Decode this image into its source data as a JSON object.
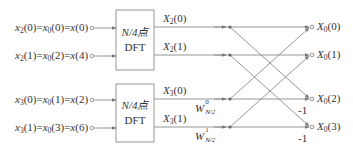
{
  "diagram": {
    "inputs": [
      {
        "id": "in0",
        "text": "x2(0)=x0(0)=x(0)",
        "parts": [
          [
            "x",
            "2",
            "(0)="
          ],
          [
            "x",
            "0",
            "(0)="
          ],
          [
            "x",
            "",
            "(0)"
          ]
        ],
        "y": 28
      },
      {
        "id": "in1",
        "text": "x2(1)=x0(2)=x(4)",
        "parts": [
          [
            "x",
            "2",
            "(1)="
          ],
          [
            "x",
            "0",
            "(2)="
          ],
          [
            "x",
            "",
            "(4)"
          ]
        ],
        "y": 56
      },
      {
        "id": "in2",
        "text": "x3(0)=x0(1)=x(2)",
        "parts": [
          [
            "x",
            "3",
            "(0)="
          ],
          [
            "x",
            "0",
            "(1)="
          ],
          [
            "x",
            "",
            "(2)"
          ]
        ],
        "y": 100
      },
      {
        "id": "in3",
        "text": "x3(1)=x0(3)=x(6)",
        "parts": [
          [
            "x",
            "3",
            "(1)="
          ],
          [
            "x",
            "0",
            "(3)="
          ],
          [
            "x",
            "",
            "(6)"
          ]
        ],
        "y": 128
      }
    ],
    "blocks": [
      {
        "id": "dft-top",
        "line1": "N/4点",
        "line2": "DFT"
      },
      {
        "id": "dft-bottom",
        "line1": "N/4点",
        "line2": "DFT"
      }
    ],
    "intermediates": [
      {
        "id": "X2_0",
        "sym": "X",
        "sub": "2",
        "arg": "(0)"
      },
      {
        "id": "X2_1",
        "sym": "X",
        "sub": "2",
        "arg": "(1)"
      },
      {
        "id": "X3_0",
        "sym": "X",
        "sub": "3",
        "arg": "(0)"
      },
      {
        "id": "X3_1",
        "sym": "X",
        "sub": "3",
        "arg": "(1)"
      }
    ],
    "twiddles": [
      {
        "id": "W0",
        "sym": "W",
        "sup": "0",
        "sub": "N/2"
      },
      {
        "id": "W1",
        "sym": "W",
        "sup": "1",
        "sub": "N/2"
      }
    ],
    "outputs": [
      {
        "id": "X0_0",
        "sym": "X",
        "sub": "0",
        "arg": "(0)"
      },
      {
        "id": "X0_1",
        "sym": "X",
        "sub": "0",
        "arg": "(1)"
      },
      {
        "id": "X0_2",
        "sym": "X",
        "sub": "0",
        "arg": "(2)"
      },
      {
        "id": "X0_3",
        "sym": "X",
        "sub": "0",
        "arg": "(3)"
      }
    ],
    "branch_gains": [
      "-1",
      "-1"
    ],
    "colors": {
      "line": "#8a8a8a",
      "box": "#8a8a8a",
      "text": "#333333",
      "node": "#666666"
    }
  }
}
